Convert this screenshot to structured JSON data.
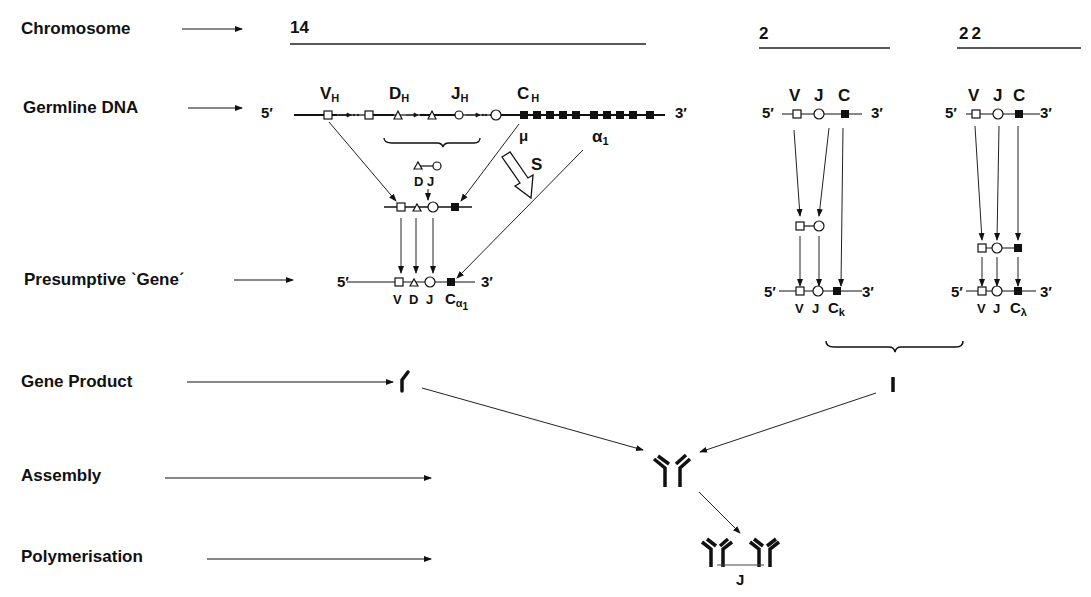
{
  "rows": {
    "chromosome": "Chromosome",
    "germline_dna": "Germline DNA",
    "presumptive_gene": "Presumptive ˋGeneˊ",
    "gene_product": "Gene Product",
    "assembly": "Assembly",
    "polymerisation": "Polymerisation"
  },
  "chromosomes": {
    "heavy": "14",
    "kappa": "2",
    "lambda": "22"
  },
  "ends": {
    "five": "5′",
    "three": "3′"
  },
  "heavy_chain": {
    "v": "V",
    "v_sub": "H",
    "d": "D",
    "d_sub": "H",
    "j": "J",
    "j_sub": "H",
    "c": "C",
    "c_sub": "H",
    "mu": "μ",
    "alpha": "α",
    "alpha_sub": "1",
    "switch": "S",
    "dj_label": "D J",
    "gene_v": "V",
    "gene_d": "D",
    "gene_j": "J",
    "gene_c": "C",
    "gene_c_sub": "α",
    "gene_c_sub2": "1"
  },
  "kappa_chain": {
    "v": "V",
    "j": "J",
    "c": "C",
    "gene_v": "V",
    "gene_j": "J",
    "gene_c": "C",
    "gene_c_sub": "k"
  },
  "lambda_chain": {
    "v": "V",
    "j": "J",
    "c": "C",
    "gene_v": "V",
    "gene_j": "J",
    "gene_c": "C",
    "gene_c_sub": "λ"
  },
  "polymer": {
    "j_chain": "J"
  },
  "legend_shapes": {
    "v_segment": "open-square",
    "d_segment": "open-triangle",
    "j_segment": "open-circle",
    "c_segment": "filled-square"
  },
  "colors": {
    "ink": "#111111",
    "background": "#ffffff"
  }
}
